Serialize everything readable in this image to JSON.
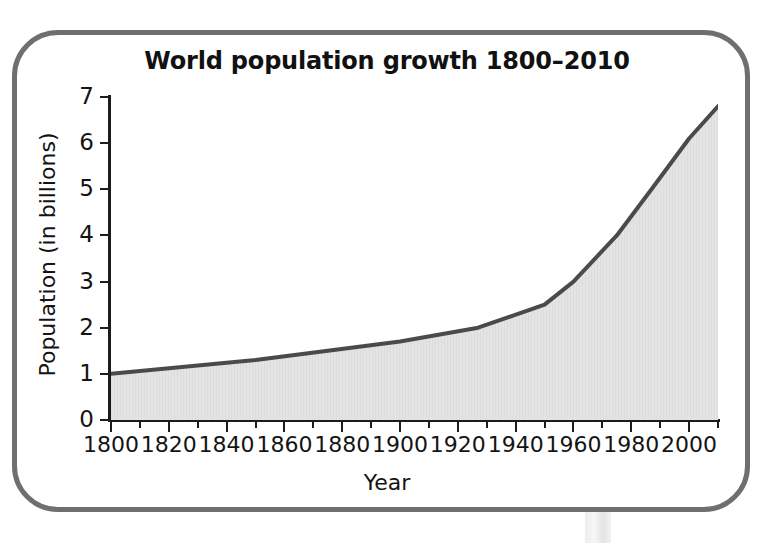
{
  "chart_data": {
    "type": "area",
    "title": "World population growth 1800–2010",
    "xlabel": "Year",
    "ylabel": "Population (in billions)",
    "xlim": [
      1800,
      2010
    ],
    "ylim": [
      0,
      7
    ],
    "grid": false,
    "legend": null,
    "x_tick_labels": [
      "1800",
      "1820",
      "1840",
      "1860",
      "1880",
      "1900",
      "1920",
      "1940",
      "1960",
      "1980",
      "2000"
    ],
    "x_major_ticks": [
      1800,
      1820,
      1840,
      1860,
      1880,
      1900,
      1920,
      1940,
      1960,
      1980,
      2000
    ],
    "x_minor_ticks": [
      1810,
      1830,
      1850,
      1870,
      1890,
      1910,
      1930,
      1950,
      1970,
      1990,
      2010
    ],
    "y_tick_labels": [
      "0",
      "1",
      "2",
      "3",
      "4",
      "5",
      "6",
      "7"
    ],
    "y_ticks": [
      0,
      1,
      2,
      3,
      4,
      5,
      6,
      7
    ],
    "x": [
      1800,
      1850,
      1900,
      1927,
      1950,
      1960,
      1975,
      1987,
      2000,
      2010
    ],
    "values": [
      1.0,
      1.3,
      1.7,
      2.0,
      2.5,
      3.0,
      4.0,
      5.0,
      6.1,
      6.8
    ],
    "series": [
      {
        "name": "World population",
        "x": [
          1800,
          1850,
          1900,
          1927,
          1950,
          1960,
          1975,
          1987,
          2000,
          2010
        ],
        "values": [
          1.0,
          1.3,
          1.7,
          2.0,
          2.5,
          3.0,
          4.0,
          5.0,
          6.1,
          6.8
        ]
      }
    ],
    "line_color": "#4a4a4a",
    "fill_color": "#e3e3e3",
    "axis_color": "#1c1c1c",
    "frame_color": "#6f6f6f"
  }
}
